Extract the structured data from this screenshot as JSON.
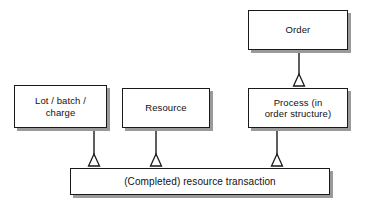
{
  "diagram": {
    "type": "uml-generalization",
    "background_color": "#ffffff",
    "box_fill_color": "#ffffff",
    "box_border_color": "#1a1a1a",
    "shadow_color": "#9a9a9a",
    "line_color": "#1a1a1a",
    "nodes": {
      "order": {
        "label": "Order"
      },
      "lot_batch_charge": {
        "label": "Lot / batch /\ncharge"
      },
      "resource": {
        "label": "Resource"
      },
      "process": {
        "label": "Process (in\norder structure)"
      },
      "resource_transaction": {
        "label": "(Completed) resource transaction"
      }
    },
    "connections": [
      {
        "from": "order",
        "to": "process",
        "marker": "hollow-triangle"
      },
      {
        "from": "lot_batch_charge",
        "to": "resource_transaction",
        "marker": "hollow-triangle"
      },
      {
        "from": "resource",
        "to": "resource_transaction",
        "marker": "hollow-triangle"
      },
      {
        "from": "process",
        "to": "resource_transaction",
        "marker": "hollow-triangle"
      }
    ]
  }
}
